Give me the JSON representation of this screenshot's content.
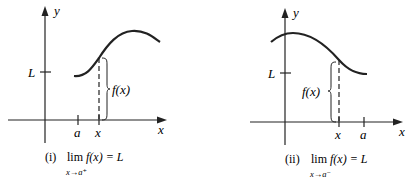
{
  "panels": [
    {
      "id": "i",
      "axis_labels": {
        "y": "y",
        "x": "x"
      },
      "tick_labels": {
        "L": "L",
        "a": "a",
        "x": "x"
      },
      "bracket_label": "f(x)",
      "caption": {
        "number": "(i)",
        "lim": "lim",
        "expr": "f(x) = L",
        "sub": "x→a⁺"
      }
    },
    {
      "id": "ii",
      "axis_labels": {
        "y": "y",
        "x": "x"
      },
      "tick_labels": {
        "L": "L",
        "a": "a",
        "x": "x"
      },
      "bracket_label": "f(x)",
      "caption": {
        "number": "(ii)",
        "lim": "lim",
        "expr": "f(x) = L",
        "sub": "x→a⁻"
      }
    }
  ],
  "colors": {
    "ink": "#222222",
    "background": "#ffffff"
  }
}
